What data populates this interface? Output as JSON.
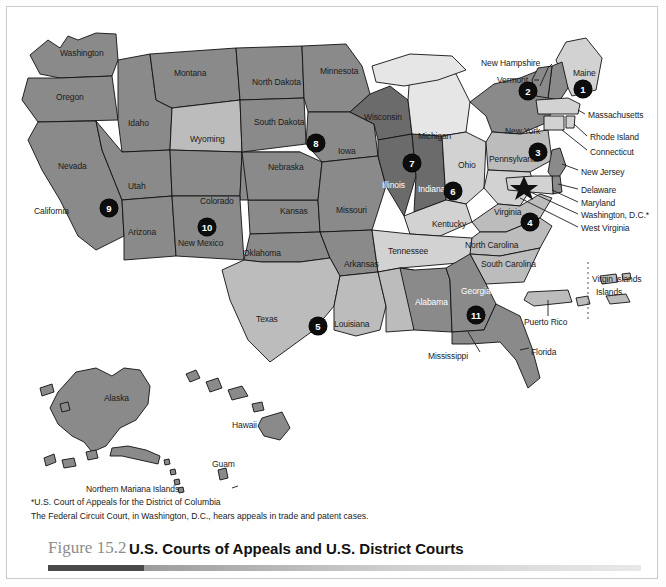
{
  "figure": {
    "number_label": "Figure 15.2",
    "title": "U.S. Courts of Appeals and U.S. District Courts"
  },
  "footnotes": [
    "*U.S. Court of Appeals for the District of Columbia",
    "The Federal Circuit Court, in Washington, D.C., hears appeals in trade and patent cases."
  ],
  "map": {
    "state_labels": [
      {
        "name": "Washington",
        "x": 64,
        "y": 52
      },
      {
        "name": "Montana",
        "x": 176,
        "y": 72
      },
      {
        "name": "North Dakota",
        "x": 258,
        "y": 81
      },
      {
        "name": "Minnesota",
        "x": 326,
        "y": 70
      },
      {
        "name": "Oregon",
        "x": 60,
        "y": 95
      },
      {
        "name": "Idaho",
        "x": 130,
        "y": 121
      },
      {
        "name": "Wyoming",
        "x": 196,
        "y": 137
      },
      {
        "name": "South Dakota",
        "x": 259,
        "y": 120
      },
      {
        "name": "Wisconsin",
        "x": 368,
        "y": 116
      },
      {
        "name": "Michigan",
        "x": 424,
        "y": 135
      },
      {
        "name": "New York",
        "x": 517,
        "y": 130
      },
      {
        "name": "Nevada",
        "x": 62,
        "y": 164
      },
      {
        "name": "Utah",
        "x": 130,
        "y": 184
      },
      {
        "name": "Colorado",
        "x": 207,
        "y": 199
      },
      {
        "name": "Nebraska",
        "x": 273,
        "y": 165
      },
      {
        "name": "Iowa",
        "x": 343,
        "y": 149
      },
      {
        "name": "Illinois",
        "x": 388,
        "y": 183
      },
      {
        "name": "Indiana",
        "x": 425,
        "y": 187
      },
      {
        "name": "Ohio",
        "x": 463,
        "y": 163
      },
      {
        "name": "Pennsylvania",
        "x": 500,
        "y": 157
      },
      {
        "name": "California",
        "x": 38,
        "y": 209
      },
      {
        "name": "Kansas",
        "x": 285,
        "y": 209
      },
      {
        "name": "Missouri",
        "x": 342,
        "y": 208
      },
      {
        "name": "Kentucky",
        "x": 438,
        "y": 222
      },
      {
        "name": "Virginia",
        "x": 499,
        "y": 210
      },
      {
        "name": "Arizona",
        "x": 131,
        "y": 230
      },
      {
        "name": "New Mexico",
        "x": 185,
        "y": 241
      },
      {
        "name": "Oklahoma",
        "x": 250,
        "y": 251
      },
      {
        "name": "Arkansas",
        "x": 350,
        "y": 262
      },
      {
        "name": "Tennessee",
        "x": 396,
        "y": 249
      },
      {
        "name": "North Carolina",
        "x": 487,
        "y": 243
      },
      {
        "name": "South Carolina",
        "x": 495,
        "y": 262
      },
      {
        "name": "Georgia",
        "x": 468,
        "y": 289
      },
      {
        "name": "Alabama",
        "x": 424,
        "y": 300
      },
      {
        "name": "Texas",
        "x": 260,
        "y": 317
      },
      {
        "name": "Louisiana",
        "x": 343,
        "y": 322
      },
      {
        "name": "Mississippi",
        "x": 430,
        "y": 354
      },
      {
        "name": "Florida",
        "x": 534,
        "y": 350
      },
      {
        "name": "Alaska",
        "x": 110,
        "y": 396
      },
      {
        "name": "Hawaii",
        "x": 238,
        "y": 423
      },
      {
        "name": "Guam",
        "x": 216,
        "y": 465
      },
      {
        "name": "Northern Mariana Islands",
        "x": 86,
        "y": 487
      },
      {
        "name": "Puerto Rico",
        "x": 531,
        "y": 320
      },
      {
        "name": "Virgin Islands",
        "x": 597,
        "y": 280
      }
    ],
    "callout_labels": [
      {
        "name": "New Hampshire",
        "x": 487,
        "y": 62
      },
      {
        "name": "Vermont",
        "x": 501,
        "y": 78
      },
      {
        "name": "Maine",
        "x": 578,
        "y": 71
      },
      {
        "name": "Massachusetts",
        "x": 588,
        "y": 115
      },
      {
        "name": "Rhode Island",
        "x": 590,
        "y": 137
      },
      {
        "name": "Connecticut",
        "x": 590,
        "y": 152
      },
      {
        "name": "New Jersey",
        "x": 581,
        "y": 172
      },
      {
        "name": "Delaware",
        "x": 581,
        "y": 190
      },
      {
        "name": "Maryland",
        "x": 581,
        "y": 203
      },
      {
        "name": "Washington, D.C.*",
        "x": 581,
        "y": 215
      },
      {
        "name": "West Virginia",
        "x": 581,
        "y": 228
      }
    ],
    "circuit_badges": [
      {
        "number": "1",
        "x": 583,
        "y": 89
      },
      {
        "number": "2",
        "x": 528,
        "y": 91
      },
      {
        "number": "3",
        "x": 538,
        "y": 152
      },
      {
        "number": "4",
        "x": 530,
        "y": 222
      },
      {
        "number": "5",
        "x": 318,
        "y": 326
      },
      {
        "number": "6",
        "x": 453,
        "y": 191
      },
      {
        "number": "7",
        "x": 412,
        "y": 163
      },
      {
        "number": "8",
        "x": 316,
        "y": 143
      },
      {
        "number": "9",
        "x": 109,
        "y": 208
      },
      {
        "number": "10",
        "x": 207,
        "y": 227
      },
      {
        "number": "11",
        "x": 476,
        "y": 315
      }
    ],
    "markers": [
      {
        "name": "dc-star",
        "x": 524,
        "y": 185
      }
    ]
  },
  "colors": {
    "shade_dark": "#6b6b6b",
    "shade_medium": "#8a8a8a",
    "shade_light": "#bcbcbc",
    "shade_lighter": "#d2d2d2",
    "shade_lightest": "#e6e6e6",
    "outline": "#111111",
    "badge_bg": "#0d0d0d",
    "caption_rule_dark": "#4a4a4a"
  }
}
